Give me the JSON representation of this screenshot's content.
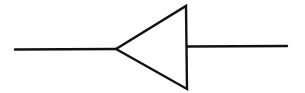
{
  "diagram": {
    "type": "schematic-symbol",
    "symbol": "amplifier-triangle-pointing-left",
    "stroke_color": "#111111",
    "background_color": "#ffffff",
    "stroke_width": 2.4,
    "elements": {
      "left_lead": {
        "x1": 15,
        "y1": 49.5,
        "x2": 116,
        "y2": 49
      },
      "triangle": {
        "points": [
          [
            116,
            49
          ],
          [
            186,
            6
          ],
          [
            187,
            89
          ]
        ]
      },
      "right_lead": {
        "x1": 187,
        "y1": 46.5,
        "x2": 287,
        "y2": 46
      }
    }
  }
}
